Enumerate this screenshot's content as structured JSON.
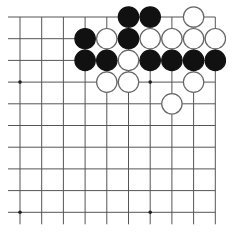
{
  "board": {
    "description": "Go board fragment (top-right corner view)",
    "columns": 10,
    "rows": 10,
    "edges": {
      "top": true,
      "right": true,
      "left": false,
      "bottom": false
    },
    "colors": {
      "line": "#555555",
      "black_stone": "#111111",
      "white_stone": "#ffffff",
      "white_outline": "#666666",
      "background": "#ffffff"
    },
    "star_points": [
      [
        0,
        3
      ],
      [
        6,
        3
      ],
      [
        0,
        9
      ],
      [
        6,
        9
      ]
    ],
    "stones": [
      {
        "col": 5,
        "row": 0,
        "color": "black"
      },
      {
        "col": 6,
        "row": 0,
        "color": "black"
      },
      {
        "col": 8,
        "row": 0,
        "color": "white"
      },
      {
        "col": 3,
        "row": 1,
        "color": "black"
      },
      {
        "col": 4,
        "row": 1,
        "color": "white"
      },
      {
        "col": 5,
        "row": 1,
        "color": "black"
      },
      {
        "col": 6,
        "row": 1,
        "color": "white"
      },
      {
        "col": 7,
        "row": 1,
        "color": "white"
      },
      {
        "col": 8,
        "row": 1,
        "color": "white"
      },
      {
        "col": 9,
        "row": 1,
        "color": "white"
      },
      {
        "col": 3,
        "row": 2,
        "color": "black"
      },
      {
        "col": 4,
        "row": 2,
        "color": "black"
      },
      {
        "col": 5,
        "row": 2,
        "color": "white"
      },
      {
        "col": 6,
        "row": 2,
        "color": "black"
      },
      {
        "col": 7,
        "row": 2,
        "color": "black"
      },
      {
        "col": 8,
        "row": 2,
        "color": "black"
      },
      {
        "col": 9,
        "row": 2,
        "color": "black"
      },
      {
        "col": 4,
        "row": 3,
        "color": "white"
      },
      {
        "col": 5,
        "row": 3,
        "color": "white"
      },
      {
        "col": 8,
        "row": 3,
        "color": "white"
      },
      {
        "col": 7,
        "row": 4,
        "color": "white"
      }
    ]
  }
}
